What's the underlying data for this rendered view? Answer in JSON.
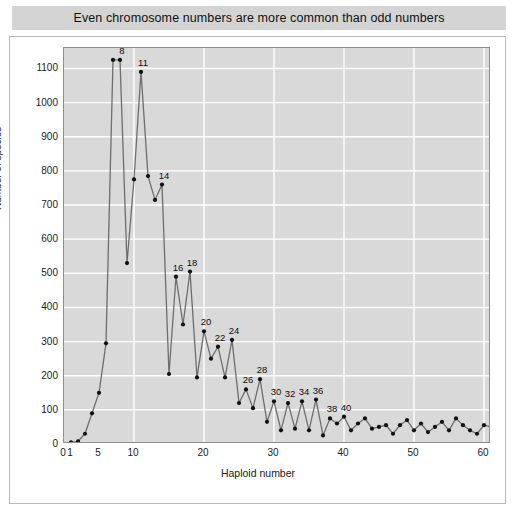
{
  "title": {
    "text": "Even chromosome numbers are more common than odd numbers"
  },
  "axis": {
    "ylabel": "Number of species",
    "xlabel": "Haploid number"
  },
  "chart_data": {
    "type": "line",
    "title": "Even chromosome numbers are more common than odd numbers",
    "xlabel": "Haploid number",
    "ylabel": "Number of species",
    "xlim": [
      0,
      61
    ],
    "ylim": [
      0,
      1160
    ],
    "grid": true,
    "legend": "none",
    "xticks": [
      0,
      1,
      5,
      10,
      20,
      30,
      40,
      50,
      60
    ],
    "yticks": [
      0,
      100,
      200,
      300,
      400,
      500,
      600,
      700,
      800,
      900,
      1000,
      1100
    ],
    "x": [
      1,
      2,
      3,
      4,
      5,
      6,
      7,
      8,
      9,
      10,
      11,
      12,
      13,
      14,
      15,
      16,
      17,
      18,
      19,
      20,
      21,
      22,
      23,
      24,
      25,
      26,
      27,
      28,
      29,
      30,
      31,
      32,
      33,
      34,
      35,
      36,
      37,
      38,
      39,
      40,
      41,
      42,
      43,
      44,
      45,
      46,
      47,
      48,
      49,
      50,
      51,
      52,
      53,
      54,
      55,
      56,
      57,
      58,
      59,
      60,
      61
    ],
    "values": [
      5,
      8,
      30,
      90,
      150,
      295,
      1125,
      1125,
      530,
      775,
      1090,
      785,
      715,
      760,
      205,
      490,
      350,
      505,
      195,
      330,
      250,
      285,
      195,
      305,
      120,
      160,
      105,
      190,
      65,
      125,
      40,
      120,
      45,
      125,
      40,
      130,
      25,
      75,
      60,
      80,
      40,
      60,
      75,
      45,
      50,
      55,
      30,
      55,
      70,
      40,
      60,
      35,
      50,
      65,
      40,
      75,
      55,
      40,
      30,
      55,
      50
    ],
    "point_labels": [
      {
        "x": 8,
        "value": 1125,
        "text": "8"
      },
      {
        "x": 11,
        "value": 1090,
        "text": "11"
      },
      {
        "x": 14,
        "value": 760,
        "text": "14"
      },
      {
        "x": 16,
        "value": 490,
        "text": "16"
      },
      {
        "x": 18,
        "value": 505,
        "text": "18"
      },
      {
        "x": 20,
        "value": 330,
        "text": "20"
      },
      {
        "x": 22,
        "value": 285,
        "text": "22"
      },
      {
        "x": 24,
        "value": 305,
        "text": "24"
      },
      {
        "x": 26,
        "value": 160,
        "text": "26"
      },
      {
        "x": 28,
        "value": 190,
        "text": "28"
      },
      {
        "x": 30,
        "value": 125,
        "text": "30"
      },
      {
        "x": 32,
        "value": 120,
        "text": "32"
      },
      {
        "x": 34,
        "value": 125,
        "text": "34"
      },
      {
        "x": 36,
        "value": 130,
        "text": "36"
      },
      {
        "x": 38,
        "value": 75,
        "text": "38"
      },
      {
        "x": 40,
        "value": 80,
        "text": "40"
      }
    ],
    "style": {
      "plot_background": "#d9d9d9",
      "grid_color": "#ffffff",
      "line_color": "#6e6e6e",
      "marker_color": "#111111",
      "banner_background": "#d4d4d4"
    }
  }
}
